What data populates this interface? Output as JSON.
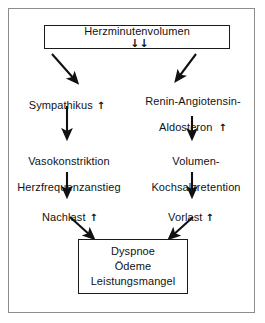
{
  "figure": {
    "language": "de",
    "border_color": "#8d8d8d",
    "ink_color": "#121212",
    "background": "#ffffff"
  },
  "nodes": {
    "cardiac_output": {
      "label": "Herzminutenvolumen",
      "trend_glyph": "↓↓",
      "trend": "decreased-strongly",
      "shape": "rectangle"
    },
    "sympathetic": {
      "label": "Sympathikus",
      "trend_glyph": "↑",
      "trend": "increased"
    },
    "raas": {
      "label": "Renin-Angiotensin-\nAldosteron",
      "line1": "Renin-Angiotensin-",
      "line2": "Aldosteron",
      "trend_glyph": "↑",
      "trend": "increased"
    },
    "vasoconstriction": {
      "label": "Vasokonstriktion\nHerzfrequenzanstieg",
      "line1": "Vasokonstriktion",
      "line2": "Herzfrequenzanstieg"
    },
    "volume_retention": {
      "label": "Volumen-\nKochsalzretention",
      "line1": "Volumen-",
      "line2": "Kochsalzretention"
    },
    "afterload": {
      "label": "Nachlast",
      "trend_glyph": "↑",
      "trend": "increased"
    },
    "preload": {
      "label": "Vorlast",
      "trend_glyph": "↑",
      "trend": "increased"
    },
    "symptoms": {
      "line1": "Dyspnoe",
      "line2": "Ödeme",
      "line3": "Leistungsmangel",
      "shape": "rectangle"
    }
  },
  "edges": [
    {
      "id": "edge-hmv-sympathikus",
      "from": "cardiac_output",
      "to": "sympathetic",
      "style": "diagonal-down-left"
    },
    {
      "id": "edge-hmv-raas",
      "from": "cardiac_output",
      "to": "raas",
      "style": "diagonal-down-right"
    },
    {
      "id": "edge-sympathikus-vasokonstriktion",
      "from": "sympathetic",
      "to": "vasoconstriction",
      "style": "vertical-down"
    },
    {
      "id": "edge-raas-volumen",
      "from": "raas",
      "to": "volume_retention",
      "style": "vertical-down"
    },
    {
      "id": "edge-vasokonstriktion-nachlast",
      "from": "vasoconstriction",
      "to": "afterload",
      "style": "vertical-down"
    },
    {
      "id": "edge-volumen-vorlast",
      "from": "volume_retention",
      "to": "preload",
      "style": "vertical-down"
    },
    {
      "id": "edge-nachlast-symptoms",
      "from": "afterload",
      "to": "symptoms",
      "style": "diagonal-down-right"
    },
    {
      "id": "edge-vorlast-symptoms",
      "from": "preload",
      "to": "symptoms",
      "style": "diagonal-down-left"
    }
  ]
}
